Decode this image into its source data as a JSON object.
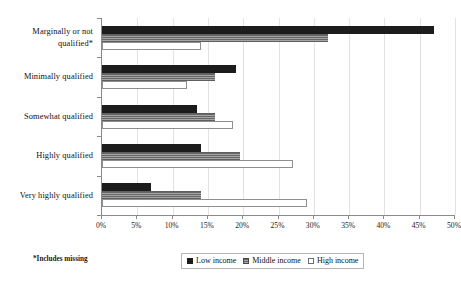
{
  "chart_data": {
    "type": "bar",
    "orientation": "horizontal",
    "title": "",
    "xlabel": "",
    "ylabel": "",
    "xlim": [
      0,
      50
    ],
    "xtick_labels": [
      "0%",
      "5%",
      "10%",
      "15%",
      "20%",
      "25%",
      "30%",
      "35%",
      "40%",
      "45%",
      "50%"
    ],
    "xtick_values": [
      0,
      5,
      10,
      15,
      20,
      25,
      30,
      35,
      40,
      45,
      50
    ],
    "grid": true,
    "grid_axis": "x",
    "legend_position": "bottom-center",
    "categories": [
      "Marginally  or not qualified*",
      "Minimally qualified",
      "Somewhat qualified",
      "Highly qualified",
      "Very highly qualified"
    ],
    "series": [
      {
        "name": "Low income",
        "color": "#1c1c1c",
        "values": [
          47.0,
          19.0,
          13.5,
          14.0,
          7.0
        ]
      },
      {
        "name": "Middle income",
        "color": "#7d7d7d",
        "values": [
          32.0,
          16.0,
          16.0,
          19.5,
          14.0
        ]
      },
      {
        "name": "High income",
        "color": "#ffffff",
        "values": [
          14.0,
          12.0,
          18.5,
          27.0,
          29.0
        ]
      }
    ],
    "annotations": [
      "*Includes missing"
    ]
  },
  "footnote": "*Includes missing",
  "legend": {
    "items": [
      {
        "label": "Low income"
      },
      {
        "label": "Middle income"
      },
      {
        "label": "High income"
      }
    ]
  }
}
